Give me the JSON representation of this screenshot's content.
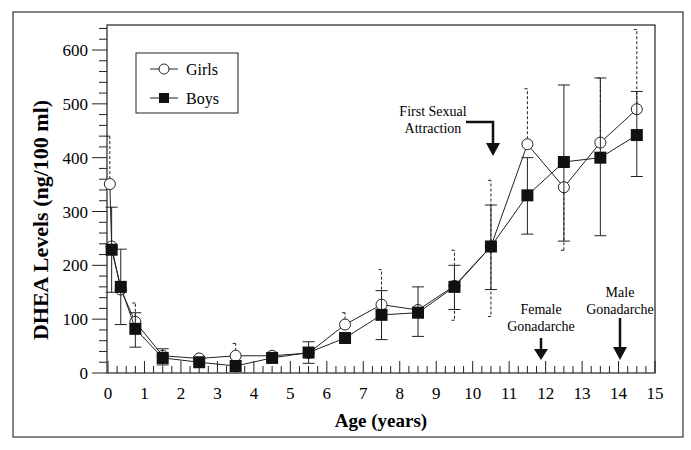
{
  "chart_data": {
    "type": "line",
    "title": "",
    "xlabel": "Age (years)",
    "ylabel": "DHEA Levels (ng/100 ml)",
    "xlim": [
      0,
      15
    ],
    "ylim": [
      0,
      650
    ],
    "xticks": [
      0,
      1,
      2,
      3,
      4,
      5,
      6,
      7,
      8,
      9,
      10,
      11,
      12,
      13,
      14,
      15
    ],
    "yticks": [
      0,
      100,
      200,
      300,
      400,
      500,
      600
    ],
    "grid": false,
    "legend_position": "upper-left",
    "series": [
      {
        "name": "Girls",
        "marker": "open-circle",
        "x": [
          0.05,
          0.1,
          0.35,
          0.75,
          1.5,
          2.5,
          3.5,
          4.5,
          5.5,
          6.5,
          7.5,
          8.5,
          9.5,
          10.5,
          11.5,
          12.5,
          13.5,
          14.5
        ],
        "values": [
          351,
          235,
          155,
          95,
          32,
          27,
          32,
          32,
          37,
          90,
          127,
          117,
          162,
          235,
          425,
          345,
          428,
          490
        ],
        "error_upper": [
          440,
          null,
          null,
          130,
          null,
          null,
          55,
          null,
          null,
          112,
          192,
          null,
          228,
          358,
          528,
          null,
          548,
          638
        ],
        "error_lower": [
          null,
          null,
          null,
          null,
          null,
          null,
          null,
          null,
          null,
          null,
          null,
          null,
          98,
          105,
          null,
          228,
          null,
          null
        ],
        "error_style": "dashed"
      },
      {
        "name": "Boys",
        "marker": "filled-square",
        "x": [
          0.1,
          0.35,
          0.75,
          1.5,
          2.5,
          3.5,
          4.5,
          5.5,
          6.5,
          7.5,
          8.5,
          9.5,
          10.5,
          11.5,
          12.5,
          13.5,
          14.5
        ],
        "values": [
          229,
          160,
          82,
          28,
          20,
          13,
          28,
          38,
          65,
          108,
          112,
          160,
          235,
          330,
          392,
          400,
          442
        ],
        "error_upper": [
          308,
          230,
          112,
          45,
          null,
          null,
          null,
          58,
          null,
          153,
          160,
          200,
          312,
          400,
          535,
          548,
          523
        ],
        "error_lower": [
          150,
          90,
          48,
          15,
          null,
          null,
          null,
          18,
          null,
          62,
          68,
          118,
          155,
          258,
          245,
          255,
          365
        ],
        "error_style": "solid"
      }
    ],
    "annotations": [
      {
        "text": [
          "First Sexual",
          "Attraction"
        ],
        "arrow_x": 10.5,
        "arrow_type": "elbow-down"
      },
      {
        "text": [
          "Female",
          "Gonadarche"
        ],
        "arrow_x": 11.9,
        "arrow_type": "down"
      },
      {
        "text": [
          "Male",
          "Gonadarche"
        ],
        "arrow_x": 14.0,
        "arrow_type": "down"
      }
    ]
  },
  "legend": {
    "girls": "Girls",
    "boys": "Boys"
  },
  "axes": {
    "xlabel": "Age (years)",
    "ylabel": "DHEA Levels (ng/100 ml)"
  },
  "annotations": {
    "first_sexual_1": "First Sexual",
    "first_sexual_2": "Attraction",
    "female_1": "Female",
    "female_2": "Gonadarche",
    "male_1": "Male",
    "male_2": "Gonadarche"
  }
}
